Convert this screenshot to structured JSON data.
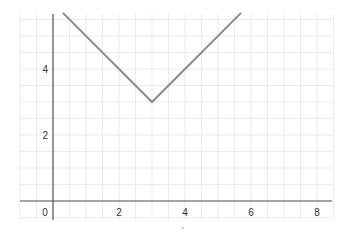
{
  "chart_data": {
    "type": "line",
    "title": "",
    "xlabel": "",
    "ylabel": "",
    "function": "y = |x - 3| + 3",
    "series": [
      {
        "name": "f(x)",
        "x": [
          0.3,
          3,
          5.7
        ],
        "y": [
          5.7,
          3,
          5.7
        ],
        "color": "#888888"
      }
    ],
    "x_ticks": [
      "0",
      "2",
      "4",
      "6",
      "8"
    ],
    "y_ticks": [
      "2",
      "4"
    ],
    "xlim": [
      -0.6,
      8.6
    ],
    "ylim": [
      -0.6,
      5.7
    ],
    "grid": true,
    "minor_grid_step": 0.5,
    "legend": "none"
  },
  "colors": {
    "axis": "#555555",
    "grid": "#e6e6e6",
    "curve": "#8a8a8a"
  }
}
